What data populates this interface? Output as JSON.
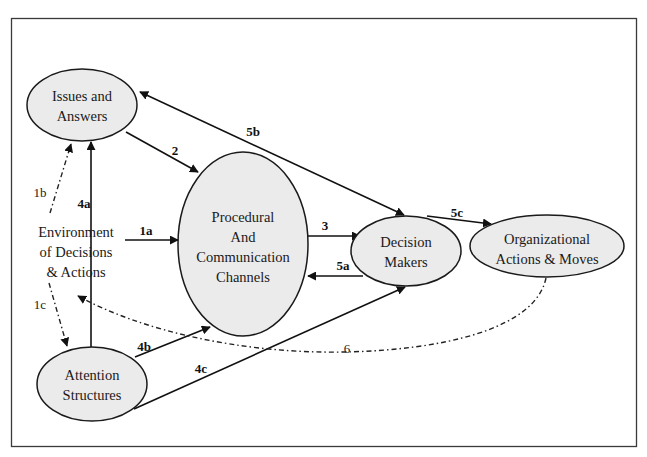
{
  "diagram": {
    "nodes": {
      "issues": {
        "lines": [
          "Issues and",
          "Answers"
        ]
      },
      "procedural": {
        "lines": [
          "Procedural",
          "And",
          "Communication",
          "Channels"
        ]
      },
      "decision": {
        "lines": [
          "Decision",
          "Makers"
        ]
      },
      "organizational": {
        "lines": [
          "Organizational",
          "Actions & Moves"
        ]
      },
      "attention": {
        "lines": [
          "Attention",
          "Structures"
        ]
      },
      "environment": {
        "lines": [
          "Environment",
          "of Decisions",
          "& Actions"
        ]
      }
    },
    "edges": {
      "e1a": {
        "label": "1a",
        "from": "environment",
        "to": "procedural",
        "style": "solid"
      },
      "e1b": {
        "label": "1b",
        "from": "environment",
        "to": "issues",
        "style": "dashed"
      },
      "e1c": {
        "label": "1c",
        "from": "environment",
        "to": "attention",
        "style": "dashed"
      },
      "e2": {
        "label": "2",
        "from": "issues",
        "to": "procedural",
        "style": "solid"
      },
      "e3": {
        "label": "3",
        "from": "procedural",
        "to": "decision",
        "style": "solid"
      },
      "e4a": {
        "label": "4a",
        "from": "attention",
        "to": "issues",
        "style": "solid"
      },
      "e4b": {
        "label": "4b",
        "from": "attention",
        "to": "procedural",
        "style": "solid"
      },
      "e4c": {
        "label": "4c",
        "from": "attention",
        "to": "decision",
        "style": "solid"
      },
      "e5a": {
        "label": "5a",
        "from": "decision",
        "to": "procedural",
        "style": "solid"
      },
      "e5b": {
        "label": "5b",
        "from": "decision",
        "to": "issues",
        "style": "solid-bidirectional"
      },
      "e5c": {
        "label": "5c",
        "from": "decision",
        "to": "organizational",
        "style": "solid"
      },
      "e6": {
        "label": "6",
        "from": "organizational",
        "to": "environment",
        "style": "dash-dot"
      }
    },
    "colors": {
      "node_fill": "#ebebeb",
      "stroke": "#1a1a1a",
      "background": "#ffffff"
    }
  }
}
